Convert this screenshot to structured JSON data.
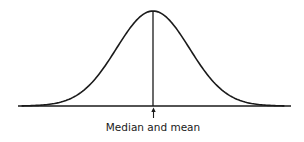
{
  "annotation": {
    "label": "Median and mean",
    "marker": "up-arrow-icon"
  },
  "chart_data": {
    "type": "line",
    "title": "",
    "xlabel": "",
    "ylabel": "",
    "distribution": "normal",
    "mean": 0,
    "median": 0,
    "std": 1,
    "xlim": [
      -3.6,
      3.6
    ],
    "ylim": [
      0,
      0.3989
    ],
    "grid": false,
    "annotations": [
      {
        "x": 0,
        "text": "Median and mean"
      }
    ],
    "colors": {
      "stroke": "#1a1a1a",
      "background": "#ffffff"
    }
  }
}
